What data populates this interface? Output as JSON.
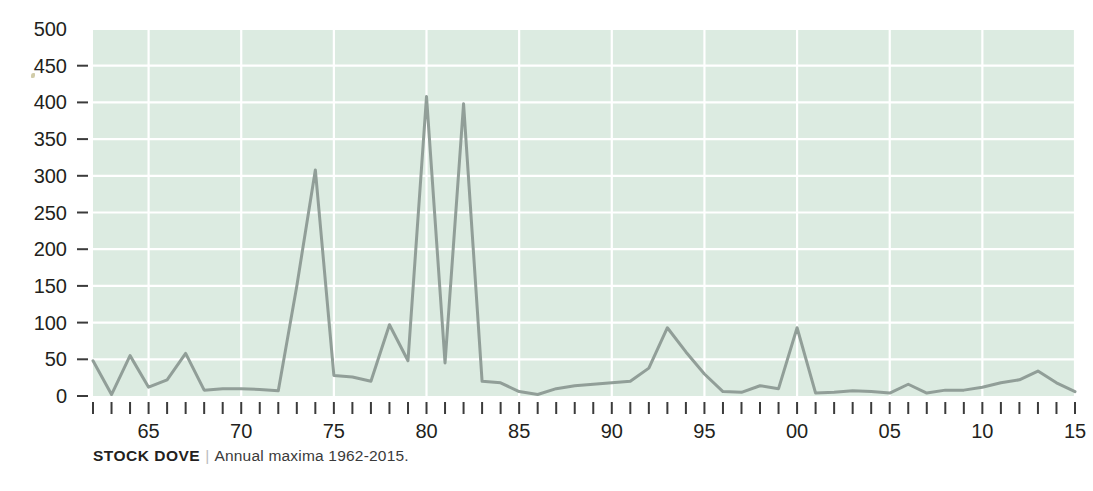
{
  "caption": {
    "species": "STOCK DOVE",
    "separator": "|",
    "description": "Annual maxima 1962-2015."
  },
  "colors": {
    "plot_background": "#dcebe1",
    "gridline": "#ffffff",
    "line": "#8c9a94",
    "tick": "#3b3b3b",
    "text": "#231f20",
    "page_background": "#ffffff"
  },
  "chart_data": {
    "type": "line",
    "title": "STOCK DOVE",
    "subtitle": "Annual maxima 1962-2015.",
    "xlabel": "",
    "ylabel": "",
    "ylim": [
      0,
      500
    ],
    "xlim": [
      1962,
      2015
    ],
    "grid": true,
    "legend": null,
    "y_ticks": [
      0,
      50,
      100,
      150,
      200,
      250,
      300,
      350,
      400,
      450,
      500
    ],
    "y_tick_labels": [
      "0",
      "50",
      "100",
      "150",
      "200",
      "250",
      "300",
      "350",
      "400",
      "450",
      "500"
    ],
    "x_tick_labels": [
      "65",
      "70",
      "75",
      "80",
      "85",
      "90",
      "95",
      "00",
      "05",
      "10",
      "15"
    ],
    "x_labeled_years": [
      1965,
      1970,
      1975,
      1980,
      1985,
      1990,
      1995,
      2000,
      2005,
      2010,
      2015
    ],
    "x": [
      1962,
      1963,
      1964,
      1965,
      1966,
      1967,
      1968,
      1969,
      1970,
      1971,
      1972,
      1973,
      1974,
      1975,
      1976,
      1977,
      1978,
      1979,
      1980,
      1981,
      1982,
      1983,
      1984,
      1985,
      1986,
      1987,
      1988,
      1989,
      1990,
      1991,
      1992,
      1993,
      1994,
      1995,
      1996,
      1997,
      1998,
      1999,
      2000,
      2001,
      2002,
      2003,
      2004,
      2005,
      2006,
      2007,
      2008,
      2009,
      2010,
      2011,
      2012,
      2013,
      2014,
      2015
    ],
    "values": [
      48,
      2,
      55,
      12,
      22,
      58,
      8,
      10,
      10,
      9,
      7,
      150,
      308,
      28,
      26,
      20,
      97,
      48,
      408,
      45,
      398,
      20,
      18,
      6,
      2,
      10,
      14,
      16,
      18,
      20,
      38,
      93,
      60,
      30,
      6,
      5,
      14,
      10,
      93,
      4,
      5,
      7,
      6,
      4,
      16,
      4,
      8,
      8,
      12,
      18,
      22,
      34,
      18,
      6
    ],
    "series": [
      {
        "name": "Annual maxima",
        "values": [
          48,
          2,
          55,
          12,
          22,
          58,
          8,
          10,
          10,
          9,
          7,
          150,
          308,
          28,
          26,
          20,
          97,
          48,
          408,
          45,
          398,
          20,
          18,
          6,
          2,
          10,
          14,
          16,
          18,
          20,
          38,
          93,
          60,
          30,
          6,
          5,
          14,
          10,
          93,
          4,
          5,
          7,
          6,
          4,
          16,
          4,
          8,
          8,
          12,
          18,
          22,
          34,
          18,
          6
        ]
      }
    ],
    "annotations": []
  }
}
